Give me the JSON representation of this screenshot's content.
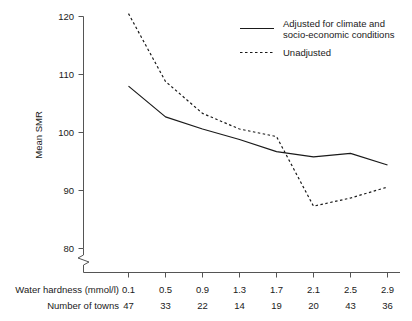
{
  "chart_data": {
    "type": "line",
    "title": "",
    "xlabel": "Water hardness (mmol/l)",
    "ylabel": "Mean SMR",
    "x": [
      0.1,
      0.5,
      0.9,
      1.3,
      1.7,
      2.1,
      2.5,
      2.9
    ],
    "categories": [
      "0.1",
      "0.5",
      "0.9",
      "1.3",
      "1.7",
      "2.1",
      "2.5",
      "2.9"
    ],
    "ylim": [
      80,
      120
    ],
    "yticks": [
      80,
      90,
      100,
      110,
      120
    ],
    "ytick_labels": [
      "80",
      "90",
      "100",
      "110",
      "120"
    ],
    "axis_break": true,
    "grid": false,
    "legend_position": "top-right",
    "series": [
      {
        "name": "Adjusted for climate and socio-economic conditions",
        "style": "solid",
        "color": "#1a1a1a",
        "values": [
          108.0,
          102.7,
          100.6,
          98.8,
          96.7,
          95.8,
          96.4,
          94.4
        ]
      },
      {
        "name": "Unadjusted",
        "style": "dotted",
        "color": "#1a1a1a",
        "values": [
          120.5,
          108.8,
          103.3,
          100.6,
          99.3,
          87.3,
          88.7,
          90.6
        ]
      }
    ],
    "secondary_row": {
      "label": "Number of towns",
      "values": [
        "47",
        "33",
        "22",
        "14",
        "19",
        "20",
        "43",
        "36"
      ]
    }
  },
  "legend": {
    "entries": [
      {
        "line1": "Adjusted for climate and",
        "line2": "socio-economic conditions",
        "style": "solid"
      },
      {
        "line1": "Unadjusted",
        "line2": "",
        "style": "dotted"
      }
    ]
  },
  "axes": {
    "y_label": "Mean SMR",
    "y_ticks": [
      "120",
      "110",
      "100",
      "90",
      "80"
    ],
    "x_row_label": "Water hardness (mmol/l)",
    "x_tick_labels": [
      "0.1",
      "0.5",
      "0.9",
      "1.3",
      "1.7",
      "2.1",
      "2.5",
      "2.9"
    ],
    "towns_row_label": "Number of towns",
    "towns_values": [
      "47",
      "33",
      "22",
      "14",
      "19",
      "20",
      "43",
      "36"
    ]
  },
  "colors": {
    "line": "#1a1a1a",
    "axis": "#555555",
    "background": "#ffffff"
  }
}
